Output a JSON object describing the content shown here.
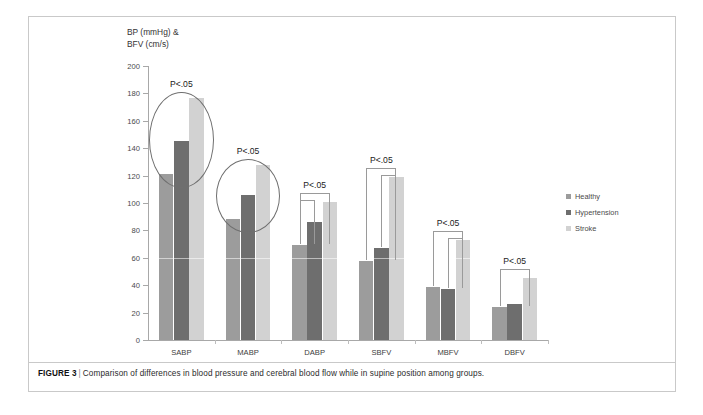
{
  "caption": {
    "label": "FIGURE 3",
    "separator": "|",
    "text": "Comparison of differences in blood pressure and cerebral blood flow while in supine position among groups."
  },
  "legend": {
    "items": [
      {
        "label": "Healthy",
        "color": "#9c9c9c"
      },
      {
        "label": "Hypertension",
        "color": "#6e6e6e"
      },
      {
        "label": "Stroke",
        "color": "#d2d2d2"
      }
    ]
  },
  "axis_title_lines": [
    "BP (mmHg) &",
    "BFV (cm/s)"
  ],
  "significance": {
    "ellipse_labels": [
      "P<.05",
      "P<.05"
    ],
    "bracket_labels": [
      "P<.05",
      "P<.05",
      "P<.05",
      "P<.05"
    ]
  },
  "chart_data": {
    "type": "bar",
    "title": "",
    "xlabel": "",
    "ylabel": "BP (mmHg) & BFV (cm/s)",
    "ylim": [
      0,
      200
    ],
    "yticks": [
      0,
      20,
      40,
      60,
      80,
      100,
      120,
      140,
      160,
      180,
      200
    ],
    "grid": false,
    "legend_position": "right",
    "categories": [
      "SABP",
      "MABP",
      "DABP",
      "SBFV",
      "MBFV",
      "DBFV"
    ],
    "series": [
      {
        "name": "Healthy",
        "color": "#9c9c9c",
        "values": [
          121,
          88,
          69,
          58,
          39,
          24
        ]
      },
      {
        "name": "Hypertension",
        "color": "#6e6e6e",
        "values": [
          145,
          106,
          86,
          67,
          37,
          26
        ]
      },
      {
        "name": "Stroke",
        "color": "#d2d2d2",
        "values": [
          177,
          128,
          101,
          119,
          73,
          45
        ]
      }
    ],
    "annotations": [
      {
        "kind": "ellipse",
        "category": "SABP",
        "text": "P<.05"
      },
      {
        "kind": "ellipse",
        "category": "MABP",
        "text": "P<.05"
      },
      {
        "kind": "bracket",
        "category": "DABP",
        "text": "P<.05",
        "spans": [
          [
            1,
            3
          ],
          [
            1,
            2
          ]
        ]
      },
      {
        "kind": "bracket",
        "category": "SBFV",
        "text": "P<.05",
        "spans": [
          [
            1,
            3
          ],
          [
            2,
            3
          ]
        ]
      },
      {
        "kind": "bracket",
        "category": "MBFV",
        "text": "P<.05",
        "spans": [
          [
            1,
            3
          ],
          [
            2,
            3
          ]
        ]
      },
      {
        "kind": "bracket",
        "category": "DBFV",
        "text": "P<.05",
        "spans": [
          [
            1,
            3
          ]
        ]
      }
    ]
  }
}
